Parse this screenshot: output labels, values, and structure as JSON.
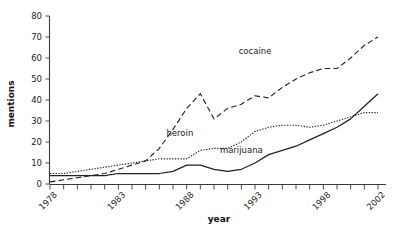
{
  "chart_data": {
    "type": "line",
    "title": "",
    "xlabel": "year",
    "ylabel": "mentions",
    "xlim": [
      1978,
      2002
    ],
    "ylim": [
      0,
      80
    ],
    "ytick_values": [
      0,
      10,
      20,
      30,
      40,
      50,
      60,
      70,
      80
    ],
    "ytick_labels": [
      "0",
      "10",
      "20",
      "30",
      "40",
      "50",
      "60",
      "70",
      "80"
    ],
    "xtick_labels": [
      "1978",
      "1983",
      "1988",
      "1993",
      "1998",
      "2002"
    ],
    "xtick_values": [
      1978,
      1983,
      1988,
      1993,
      1998,
      2002
    ],
    "minor_xticks_every": 1,
    "grid": false,
    "legend_position": "inline-annotations",
    "x": [
      1978,
      1979,
      1980,
      1981,
      1982,
      1983,
      1984,
      1985,
      1986,
      1987,
      1988,
      1989,
      1990,
      1991,
      1992,
      1993,
      1994,
      1995,
      1996,
      1997,
      1998,
      1999,
      2000,
      2001,
      2002
    ],
    "series": [
      {
        "name": "cocaine",
        "style": "dashed",
        "label_x": 1993,
        "label_y": 62,
        "values": [
          1,
          2,
          3,
          4,
          5,
          7,
          9,
          11,
          17,
          26,
          36,
          43,
          31,
          36,
          38,
          42,
          41,
          46,
          50,
          53,
          55,
          55,
          60,
          66,
          70
        ]
      },
      {
        "name": "heroin",
        "style": "dotted",
        "label_x": 1987.5,
        "label_y": 23,
        "values": [
          5,
          5,
          6,
          7,
          8,
          9,
          10,
          11,
          12,
          12,
          12,
          16,
          17,
          17,
          20,
          25,
          27,
          28,
          28,
          27,
          28,
          30,
          32,
          34,
          34
        ]
      },
      {
        "name": "marijuana",
        "style": "solid",
        "label_x": 1992,
        "label_y": 15,
        "values": [
          4,
          4,
          4,
          4,
          4,
          5,
          5,
          5,
          5,
          6,
          9,
          9,
          7,
          6,
          7,
          10,
          14,
          16,
          18,
          21,
          24,
          27,
          31,
          37,
          43
        ]
      }
    ]
  },
  "figure": {
    "background_color": "#ffffff",
    "line_color": "#222222",
    "axis_color": "#3a3a3a"
  }
}
